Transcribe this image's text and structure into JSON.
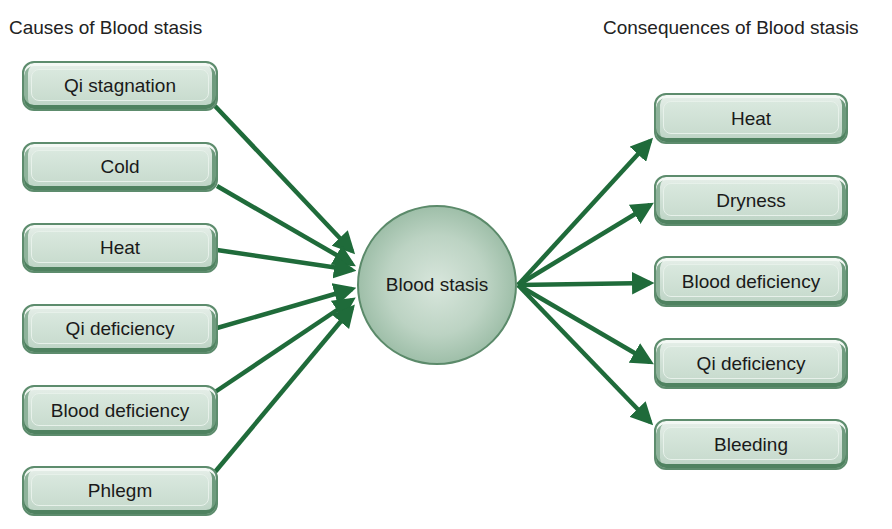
{
  "diagram": {
    "left_title": "Causes of Blood stasis",
    "right_title": "Consequences of Blood stasis",
    "center": "Blood stasis",
    "causes": [
      "Qi stagnation",
      "Cold",
      "Heat",
      "Qi deficiency",
      "Blood deficiency",
      "Phlegm"
    ],
    "consequences": [
      "Heat",
      "Dryness",
      "Blood deficiency",
      "Qi deficiency",
      "Bleeding"
    ],
    "colors": {
      "arrow": "#1f6b3a",
      "box_border": "#5d8c6d",
      "box_fill": "#cfe0d5"
    }
  }
}
